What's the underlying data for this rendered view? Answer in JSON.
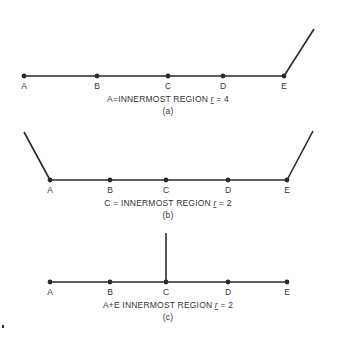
{
  "colors": {
    "ink": "#2a2a2a",
    "background": "#ffffff"
  },
  "panels": [
    {
      "id": "a",
      "line_y": 76,
      "nodes": [
        {
          "label": "A",
          "x": 24
        },
        {
          "label": "B",
          "x": 97
        },
        {
          "label": "C",
          "x": 168
        },
        {
          "label": "D",
          "x": 223
        },
        {
          "label": "E",
          "x": 284
        }
      ],
      "branches": [
        {
          "from": [
            284,
            76
          ],
          "to": [
            314,
            29
          ]
        }
      ],
      "caption_main": "A=INNERMOST REGION",
      "caption_r": "r",
      "caption_val": " = 4",
      "sublabel": "(a)"
    },
    {
      "id": "b",
      "line_y": 180,
      "nodes": [
        {
          "label": "A",
          "x": 50
        },
        {
          "label": "B",
          "x": 110
        },
        {
          "label": "C",
          "x": 166
        },
        {
          "label": "D",
          "x": 228
        },
        {
          "label": "E",
          "x": 287
        }
      ],
      "branches": [
        {
          "from": [
            50,
            180
          ],
          "to": [
            24,
            132
          ]
        },
        {
          "from": [
            287,
            180
          ],
          "to": [
            313,
            131
          ]
        }
      ],
      "caption_main": "C = INNERMOST REGION",
      "caption_r": "r",
      "caption_val": " = 2",
      "sublabel": "(b)"
    },
    {
      "id": "c",
      "line_y": 282,
      "nodes": [
        {
          "label": "A",
          "x": 50
        },
        {
          "label": "B",
          "x": 110
        },
        {
          "label": "C",
          "x": 166
        },
        {
          "label": "D",
          "x": 228
        },
        {
          "label": "E",
          "x": 287
        }
      ],
      "branches": [
        {
          "from": [
            166,
            282
          ],
          "to": [
            166,
            233
          ]
        }
      ],
      "caption_main": "A+E INNERMOST REGION",
      "caption_r": "r",
      "caption_val": " = 2",
      "sublabel": "(c)"
    }
  ]
}
